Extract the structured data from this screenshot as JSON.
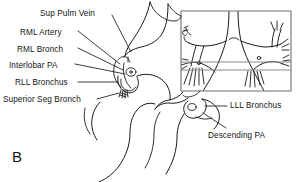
{
  "figure": {
    "panel_letter": "B",
    "background_color": "#ffffff",
    "line_color": "#1a1a1a",
    "inset_border_color": "#6e6e6e",
    "reference_line_color": "#8a8a8a"
  },
  "labels": [
    {
      "id": "sup-pulm-vein",
      "text": "Sup Pulm Vein",
      "x": 40,
      "y": 9,
      "anchor": "start"
    },
    {
      "id": "rml-artery",
      "text": "RML Artery",
      "x": 20,
      "y": 28,
      "anchor": "start"
    },
    {
      "id": "rml-bronch",
      "text": "RML Bronch",
      "x": 17,
      "y": 45,
      "anchor": "start"
    },
    {
      "id": "interlobar-pa",
      "text": "Interlobar PA",
      "x": 9,
      "y": 62,
      "anchor": "start"
    },
    {
      "id": "rll-bronchus",
      "text": "RLL Bronchus",
      "x": 15,
      "y": 79,
      "anchor": "start"
    },
    {
      "id": "superior-seg-bronch",
      "text": "Superior Seg Bronch",
      "x": 3,
      "y": 96,
      "anchor": "start"
    },
    {
      "id": "lll-bronchus",
      "text": "LLL Bronchus",
      "x": 229,
      "y": 104,
      "anchor": "start"
    },
    {
      "id": "descending-pa",
      "text": "Descending PA",
      "x": 207,
      "y": 134,
      "anchor": "start"
    }
  ],
  "leader_lines": [
    {
      "id": "leader-sup-pulm-vein",
      "from_label": "sup-pulm-vein",
      "path": "M 112,16 L 131,53"
    },
    {
      "id": "leader-rml-artery",
      "from_label": "rml-artery",
      "path": "M 76,33 L 120,66"
    },
    {
      "id": "leader-rml-bronch",
      "from_label": "rml-bronch",
      "path": "M 76,50 L 122,72"
    },
    {
      "id": "leader-interlobar-pa",
      "from_label": "interlobar-pa",
      "path": "M 74,66 L 124,78"
    },
    {
      "id": "leader-rll-bronchus",
      "from_label": "rll-bronchus",
      "path": "M 77,84 L 119,84"
    },
    {
      "id": "leader-superior-seg-bronch",
      "from_label": "superior-seg-bronch",
      "path": "M 95,101 L 120,94"
    },
    {
      "id": "leader-lll-bronchus",
      "from_label": "lll-bronchus",
      "path": "M 225,108 L 206,108"
    },
    {
      "id": "leader-descending-pa",
      "from_label": "descending-pa",
      "path": "M 224,130 L 205,115"
    }
  ],
  "inset": {
    "id": "bronchial-tree-inset",
    "x": 181,
    "y": 11,
    "width": 110,
    "height": 80,
    "reference_lines": [
      {
        "id": "upper-reference-line",
        "y": 62
      },
      {
        "id": "lower-reference-line",
        "y": 70
      }
    ]
  },
  "structures": [
    {
      "id": "right-hilum-outline",
      "name": "right hilar vessel outline"
    },
    {
      "id": "left-hilum-outline",
      "name": "left hilar vessel outline"
    },
    {
      "id": "carina",
      "name": "tracheal carina"
    },
    {
      "id": "right-main-bronchus",
      "name": "right main bronchus"
    },
    {
      "id": "left-main-bronchus",
      "name": "left main bronchus"
    }
  ]
}
